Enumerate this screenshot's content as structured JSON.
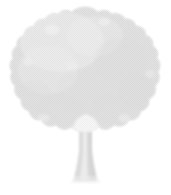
{
  "canvas": {
    "width": 171,
    "height": 195,
    "background_color": "#ffffff"
  },
  "illustration": {
    "subject": "deciduous-tree",
    "title": "Tree",
    "style": "halftone-dither-silhouette",
    "colors": {
      "background": "#ffffff",
      "foliage_fill": "#dcdcdc",
      "foliage_light": "#e8e8e8",
      "foliage_shadow": "#d2d2d2",
      "trunk_fill": "#d9d9d9",
      "trunk_light": "#ebebeb",
      "dither_dot": "#c9c9c9"
    },
    "parts": [
      {
        "name": "canopy",
        "label": "Foliage canopy",
        "bounds": {
          "x": 11,
          "y": 7,
          "width": 149,
          "height": 128
        }
      },
      {
        "name": "trunk",
        "label": "Trunk",
        "bounds": {
          "x": 74,
          "y": 120,
          "width": 24,
          "height": 62
        }
      }
    ],
    "texture": {
      "pattern": "checkerboard-halftone",
      "cell_size_px": 2,
      "opacity": 0.55
    }
  }
}
